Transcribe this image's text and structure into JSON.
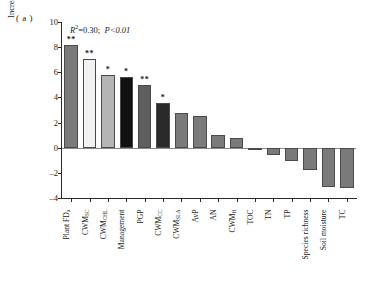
{
  "panel": {
    "label": "( a )"
  },
  "annotation": {
    "r2_prefix": "R",
    "r2_sup": "2",
    "r2_text": "=0.30;",
    "p_text": "P<0.01"
  },
  "axes": {
    "ylabel": "Increase in MSE ( % )",
    "yticks": [
      "10",
      "8",
      "6",
      "4",
      "2",
      "0",
      "-2",
      "-4"
    ],
    "ylim": [
      -4,
      10
    ]
  },
  "chart_data": {
    "type": "bar",
    "title": "",
    "xlabel": "",
    "ylabel": "Increase in MSE ( % )",
    "ylim": [
      -4,
      10
    ],
    "grid": false,
    "legend": false,
    "annotations": [
      "R2=0.30;  P<0.01",
      "(a)"
    ],
    "categories": [
      "Plant FD_u",
      "CWM_SC",
      "CWM_CHL",
      "Management",
      "PGP",
      "CWM_CC",
      "CWM_SLA",
      "AvP",
      "AN",
      "CWM_H",
      "TOC",
      "TN",
      "TP",
      "Species richness",
      "Soil moisture",
      "TC"
    ],
    "category_labels": [
      {
        "base": "Plant FD",
        "sub": "u"
      },
      {
        "base": "CWM",
        "sub": "SC"
      },
      {
        "base": "CWM",
        "sub": "CHL"
      },
      {
        "base": "Management",
        "sub": ""
      },
      {
        "base": "PGP",
        "sub": ""
      },
      {
        "base": "CWM",
        "sub": "CC"
      },
      {
        "base": "CWM",
        "sub": "SLA"
      },
      {
        "base": "AvP",
        "sub": ""
      },
      {
        "base": "AN",
        "sub": ""
      },
      {
        "base": "CWM",
        "sub": "H"
      },
      {
        "base": "TOC",
        "sub": ""
      },
      {
        "base": "TN",
        "sub": ""
      },
      {
        "base": "TP",
        "sub": ""
      },
      {
        "base": "Species richness",
        "sub": ""
      },
      {
        "base": "Soil moisture",
        "sub": ""
      },
      {
        "base": "TC",
        "sub": ""
      }
    ],
    "values": [
      8.15,
      7.05,
      5.75,
      5.65,
      4.95,
      3.55,
      2.8,
      2.55,
      1.0,
      0.75,
      -0.05,
      -0.55,
      -1.05,
      -1.8,
      -3.15,
      -3.2
    ],
    "significance": [
      "**",
      "**",
      "*",
      "*",
      "**",
      "*",
      "",
      "",
      "",
      "",
      "",
      "",
      "",
      "",
      "",
      ""
    ],
    "bar_colors": [
      "#7a7a7a",
      "#f2f2f2",
      "#b5b5b5",
      "#111111",
      "#5e5e5e",
      "#2a2a2a",
      "#7a7a7a",
      "#7a7a7a",
      "#7a7a7a",
      "#7a7a7a",
      "#7a7a7a",
      "#7a7a7a",
      "#7a7a7a",
      "#7a7a7a",
      "#7a7a7a",
      "#7a7a7a"
    ]
  }
}
